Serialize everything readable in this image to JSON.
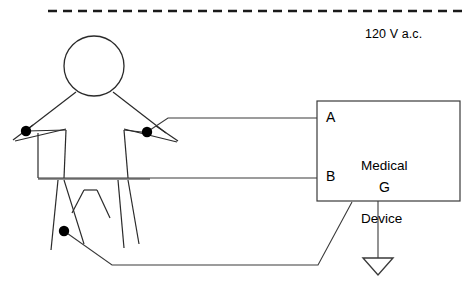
{
  "diagram": {
    "mains": {
      "voltage_label": "120 V a.c.",
      "line_style": "dashed"
    },
    "device": {
      "name_line1": "Medical",
      "name_line2": "Device",
      "terminals": [
        {
          "id": "A",
          "label": "A"
        },
        {
          "id": "B",
          "label": "B"
        },
        {
          "id": "G",
          "label": "G"
        }
      ]
    },
    "ground": {
      "symbol": "earth-ground-triangle"
    },
    "patient": {
      "figure": "stick-figure",
      "electrodes": [
        {
          "id": "left-hand",
          "label": ""
        },
        {
          "id": "right-hand",
          "label": ""
        },
        {
          "id": "leg",
          "label": ""
        }
      ]
    },
    "colors": {
      "line": "#3a3a3a",
      "body": "#2a2a2a",
      "mains": "#1a1a1a",
      "electrode": "#000000",
      "background": "#ffffff"
    }
  }
}
